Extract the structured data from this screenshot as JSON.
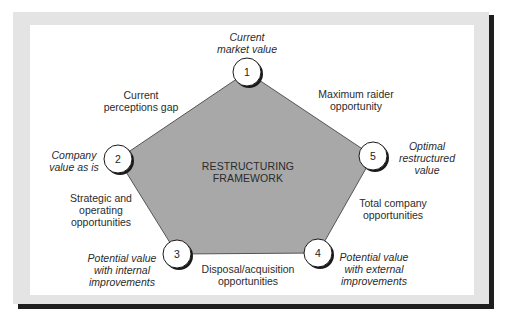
{
  "diagram": {
    "title_lines": [
      "RESTRUCTURING",
      "FRAMEWORK"
    ],
    "colors": {
      "pentagon_fill": "#a8a8a8",
      "pentagon_stroke": "#555555",
      "node_fill": "#ffffff",
      "node_stroke": "#1a1a1a",
      "node_shadow": "#1a1a1a",
      "frame": "#e4e4e4",
      "frame_shadow": "#1e1e1e",
      "panel": "#ffffff"
    },
    "nodes": [
      {
        "number": "1",
        "label_lines": [
          "Current",
          "market value"
        ]
      },
      {
        "number": "2",
        "label_lines": [
          "Company",
          "value as is"
        ]
      },
      {
        "number": "3",
        "label_lines": [
          "Potential value",
          "with internal",
          "improvements"
        ]
      },
      {
        "number": "4",
        "label_lines": [
          "Potential value",
          "with external",
          "improvements"
        ]
      },
      {
        "number": "5",
        "label_lines": [
          "Optimal",
          "restructured",
          "value"
        ]
      }
    ],
    "edges": [
      {
        "from": "1",
        "to": "2",
        "label_lines": [
          "Current",
          "perceptions gap"
        ]
      },
      {
        "from": "2",
        "to": "3",
        "label_lines": [
          "Strategic and",
          "operating",
          "opportunities"
        ]
      },
      {
        "from": "3",
        "to": "4",
        "label_lines": [
          "Disposal/acquisition",
          "opportunities"
        ]
      },
      {
        "from": "4",
        "to": "5",
        "label_lines": [
          "Total company",
          "opportunities"
        ]
      },
      {
        "from": "5",
        "to": "1",
        "label_lines": [
          "Maximum raider",
          "opportunity"
        ]
      }
    ]
  }
}
